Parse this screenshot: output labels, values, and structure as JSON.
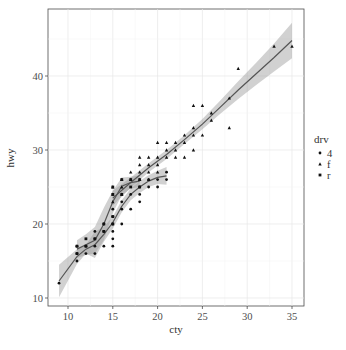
{
  "chart_data": {
    "type": "scatter",
    "title": "",
    "xlabel": "cty",
    "ylabel": "hwy",
    "xlim": [
      8,
      36
    ],
    "ylim": [
      9,
      49
    ],
    "x_ticks": [
      10,
      15,
      20,
      25,
      30,
      35
    ],
    "y_ticks": [
      10,
      20,
      30,
      40
    ],
    "grid": true,
    "legend": {
      "title": "drv",
      "position": "right",
      "entries": [
        "4",
        "f",
        "r"
      ]
    },
    "series": [
      {
        "name": "4",
        "shape": "circle",
        "points": [
          [
            9,
            12
          ],
          [
            11,
            15
          ],
          [
            11,
            16
          ],
          [
            11,
            17
          ],
          [
            12,
            16
          ],
          [
            12,
            17
          ],
          [
            13,
            16
          ],
          [
            13,
            17
          ],
          [
            13,
            18
          ],
          [
            13,
            19
          ],
          [
            14,
            17
          ],
          [
            14,
            19
          ],
          [
            14,
            20
          ],
          [
            15,
            17
          ],
          [
            15,
            18
          ],
          [
            15,
            19
          ],
          [
            15,
            20
          ],
          [
            15,
            21
          ],
          [
            15,
            22
          ],
          [
            16,
            20
          ],
          [
            16,
            22
          ],
          [
            16,
            23
          ],
          [
            17,
            22
          ],
          [
            17,
            24
          ],
          [
            18,
            23
          ],
          [
            18,
            24
          ],
          [
            18,
            25
          ],
          [
            19,
            25
          ],
          [
            19,
            26
          ],
          [
            20,
            25
          ],
          [
            20,
            26
          ],
          [
            21,
            26
          ],
          [
            21,
            27
          ]
        ],
        "smooth": [
          [
            9,
            12.3
          ],
          [
            11,
            15.6
          ],
          [
            12,
            16.6
          ],
          [
            13,
            17.2
          ],
          [
            14,
            18.6
          ],
          [
            15,
            20.2
          ],
          [
            16,
            22.4
          ],
          [
            17,
            24.0
          ],
          [
            18,
            25.0
          ],
          [
            19,
            25.8
          ],
          [
            20,
            26.3
          ],
          [
            21,
            26.5
          ]
        ]
      },
      {
        "name": "f",
        "shape": "triangle",
        "points": [
          [
            15,
            23
          ],
          [
            15,
            24
          ],
          [
            15,
            25
          ],
          [
            16,
            24
          ],
          [
            16,
            25
          ],
          [
            16,
            26
          ],
          [
            17,
            26
          ],
          [
            17,
            27
          ],
          [
            18,
            26
          ],
          [
            18,
            27
          ],
          [
            18,
            28
          ],
          [
            18,
            29
          ],
          [
            19,
            26
          ],
          [
            19,
            27
          ],
          [
            19,
            28
          ],
          [
            19,
            29
          ],
          [
            20,
            27
          ],
          [
            20,
            28
          ],
          [
            20,
            29
          ],
          [
            20,
            31
          ],
          [
            21,
            29
          ],
          [
            21,
            30
          ],
          [
            21,
            31
          ],
          [
            22,
            29
          ],
          [
            22,
            30
          ],
          [
            22,
            31
          ],
          [
            23,
            29
          ],
          [
            23,
            31
          ],
          [
            23,
            32
          ],
          [
            24,
            30
          ],
          [
            24,
            32
          ],
          [
            24,
            33
          ],
          [
            24,
            36
          ],
          [
            25,
            32
          ],
          [
            25,
            36
          ],
          [
            26,
            34
          ],
          [
            26,
            35
          ],
          [
            28,
            33
          ],
          [
            28,
            37
          ],
          [
            29,
            41
          ],
          [
            33,
            44
          ],
          [
            35,
            44
          ]
        ],
        "smooth": [
          [
            15,
            23.5
          ],
          [
            17,
            25.6
          ],
          [
            19,
            27.6
          ],
          [
            21,
            29.4
          ],
          [
            23,
            31.4
          ],
          [
            25,
            33.5
          ],
          [
            27,
            35.8
          ],
          [
            29,
            38.1
          ],
          [
            31,
            40.3
          ],
          [
            33,
            42.5
          ],
          [
            35,
            44.8
          ]
        ]
      },
      {
        "name": "r",
        "shape": "square",
        "points": [
          [
            11,
            16
          ],
          [
            11,
            17
          ],
          [
            12,
            17
          ],
          [
            12,
            18
          ],
          [
            13,
            18
          ],
          [
            14,
            19
          ],
          [
            14,
            20
          ],
          [
            15,
            20
          ],
          [
            15,
            21
          ],
          [
            15,
            24
          ],
          [
            15,
            25
          ],
          [
            16,
            24
          ],
          [
            16,
            26
          ],
          [
            17,
            25
          ],
          [
            17,
            26
          ],
          [
            18,
            25
          ],
          [
            18,
            26
          ]
        ],
        "smooth": [
          [
            11,
            16.6
          ],
          [
            12,
            17.2
          ],
          [
            13,
            17.8
          ],
          [
            14,
            20.0
          ],
          [
            15,
            23.0
          ],
          [
            16,
            25.1
          ],
          [
            17,
            25.6
          ],
          [
            18,
            25.8
          ]
        ]
      }
    ]
  },
  "axes": {
    "x_title": "cty",
    "y_title": "hwy"
  },
  "legend": {
    "title": "drv",
    "items": [
      "4",
      "f",
      "r"
    ]
  }
}
